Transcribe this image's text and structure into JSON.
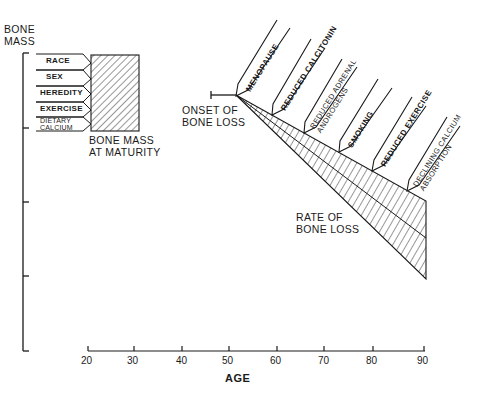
{
  "diagram": {
    "y_axis_label_line1": "BONE",
    "y_axis_label_line2": "MASS",
    "x_axis_label": "AGE",
    "x_ticks": [
      "20",
      "30",
      "40",
      "50",
      "60",
      "70",
      "80",
      "90"
    ],
    "maturity_factors": [
      "RACE",
      "SEX",
      "HEREDITY",
      "EXERCISE",
      "DIETARY",
      "CALCIUM"
    ],
    "maturity_label_line1": "BONE MASS",
    "maturity_label_line2": "AT MATURITY",
    "onset_label_line1": "ONSET OF",
    "onset_label_line2": "BONE LOSS",
    "rate_label_line1": "RATE OF",
    "rate_label_line2": "BONE LOSS",
    "loss_factors": [
      {
        "line1": "MENOPAUSE",
        "line2": ""
      },
      {
        "line1": "REDUCED CALCITONIN",
        "line2": ""
      },
      {
        "line1": "REDUCED ADRENAL",
        "line2": "ANDROGENS"
      },
      {
        "line1": "SMOKING",
        "line2": ""
      },
      {
        "line1": "REDUCED EXERCISE",
        "line2": ""
      },
      {
        "line1": "DECLINING CALCIUM",
        "line2": "ABSORPTION"
      }
    ],
    "colors": {
      "ink": "#1a1a1a",
      "background": "#ffffff"
    }
  }
}
